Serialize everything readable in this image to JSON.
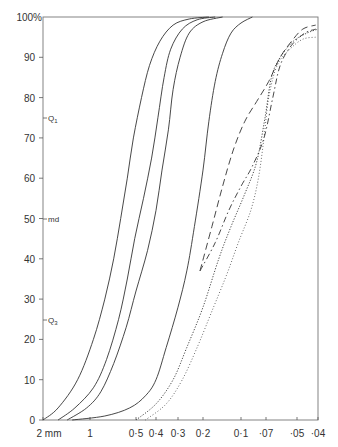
{
  "chart_data": {
    "type": "line",
    "title": "",
    "xlabel": "grain size (mm, log scale, decreasing to right)",
    "ylabel": "cumulative %",
    "y_unit_label": "100%",
    "ylim": [
      0,
      100
    ],
    "grid": false,
    "legend": null,
    "y_ticks": [
      0,
      10,
      20,
      30,
      40,
      50,
      60,
      70,
      80,
      90,
      100
    ],
    "y_tick_labels": [
      "0",
      "10",
      "20",
      "30",
      "40",
      "50",
      "60",
      "70",
      "80",
      "90",
      "100%"
    ],
    "x_ticks": [
      {
        "value": 2,
        "label": "2 mm"
      },
      {
        "value": 1,
        "label": "1"
      },
      {
        "value": 0.5,
        "label": "0·5"
      },
      {
        "value": 0.4,
        "label": "0·4"
      },
      {
        "value": 0.3,
        "label": "0·3"
      },
      {
        "value": 0.2,
        "label": "0·2"
      },
      {
        "value": 0.1,
        "label": "0·1"
      },
      {
        "value": 0.07,
        "label": "·07"
      },
      {
        "value": 0.05,
        "label": "·05"
      },
      {
        "value": 0.04,
        "label": "·04"
      }
    ],
    "annotations": [
      {
        "label": "Q1",
        "y": 75
      },
      {
        "label": "md",
        "y": 50
      },
      {
        "label": "Q3",
        "y": 25
      }
    ],
    "series": [
      {
        "name": "solid-1",
        "style": "solid",
        "points": [
          [
            2,
            0
          ],
          [
            1.6,
            3
          ],
          [
            1.2,
            10
          ],
          [
            0.95,
            20
          ],
          [
            0.8,
            30
          ],
          [
            0.7,
            40
          ],
          [
            0.63,
            50
          ],
          [
            0.57,
            60
          ],
          [
            0.52,
            70
          ],
          [
            0.47,
            80
          ],
          [
            0.43,
            88
          ],
          [
            0.38,
            94
          ],
          [
            0.32,
            98
          ],
          [
            0.25,
            99.5
          ],
          [
            0.18,
            100
          ]
        ]
      },
      {
        "name": "solid-2",
        "style": "solid",
        "points": [
          [
            1.6,
            0
          ],
          [
            1.25,
            3
          ],
          [
            0.95,
            8
          ],
          [
            0.78,
            15
          ],
          [
            0.65,
            25
          ],
          [
            0.57,
            35
          ],
          [
            0.51,
            45
          ],
          [
            0.46,
            55
          ],
          [
            0.42,
            65
          ],
          [
            0.39,
            75
          ],
          [
            0.36,
            85
          ],
          [
            0.33,
            92
          ],
          [
            0.28,
            97
          ],
          [
            0.22,
            99.3
          ],
          [
            0.16,
            100
          ]
        ]
      },
      {
        "name": "solid-3",
        "style": "solid",
        "points": [
          [
            1.4,
            0
          ],
          [
            1.05,
            3
          ],
          [
            0.85,
            7
          ],
          [
            0.7,
            14
          ],
          [
            0.58,
            23
          ],
          [
            0.5,
            32
          ],
          [
            0.44,
            42
          ],
          [
            0.4,
            52
          ],
          [
            0.37,
            62
          ],
          [
            0.34,
            72
          ],
          [
            0.32,
            82
          ],
          [
            0.29,
            90
          ],
          [
            0.25,
            96
          ],
          [
            0.2,
            98.8
          ],
          [
            0.14,
            100
          ]
        ]
      },
      {
        "name": "solid-4",
        "style": "solid",
        "points": [
          [
            1.3,
            0
          ],
          [
            0.8,
            1
          ],
          [
            0.55,
            3
          ],
          [
            0.45,
            6
          ],
          [
            0.4,
            10
          ],
          [
            0.35,
            18
          ],
          [
            0.3,
            28
          ],
          [
            0.26,
            37
          ],
          [
            0.23,
            48
          ],
          [
            0.2,
            62
          ],
          [
            0.18,
            74
          ],
          [
            0.16,
            84
          ],
          [
            0.14,
            91
          ],
          [
            0.12,
            96
          ],
          [
            0.1,
            98.5
          ],
          [
            0.085,
            100
          ]
        ]
      },
      {
        "name": "dashed",
        "style": "dashed",
        "points": [
          [
            0.21,
            37
          ],
          [
            0.17,
            48
          ],
          [
            0.14,
            58
          ],
          [
            0.115,
            67
          ],
          [
            0.095,
            74
          ],
          [
            0.08,
            79
          ],
          [
            0.068,
            84
          ],
          [
            0.06,
            90
          ],
          [
            0.053,
            94
          ],
          [
            0.047,
            97
          ],
          [
            0.041,
            98
          ]
        ]
      },
      {
        "name": "dash-dot",
        "style": "dashdot",
        "points": [
          [
            0.21,
            37
          ],
          [
            0.16,
            44
          ],
          [
            0.125,
            52
          ],
          [
            0.1,
            58
          ],
          [
            0.085,
            63
          ],
          [
            0.072,
            70
          ],
          [
            0.065,
            80
          ],
          [
            0.06,
            88
          ],
          [
            0.053,
            93
          ],
          [
            0.046,
            96
          ],
          [
            0.041,
            97
          ]
        ]
      },
      {
        "name": "dense-dotted",
        "style": "dotted",
        "points": [
          [
            0.5,
            0
          ],
          [
            0.4,
            4
          ],
          [
            0.32,
            10
          ],
          [
            0.26,
            18
          ],
          [
            0.2,
            28
          ],
          [
            0.15,
            40
          ],
          [
            0.12,
            48
          ],
          [
            0.095,
            56
          ],
          [
            0.08,
            64
          ],
          [
            0.071,
            75
          ],
          [
            0.066,
            85
          ],
          [
            0.06,
            90
          ],
          [
            0.052,
            94
          ],
          [
            0.045,
            96
          ],
          [
            0.04,
            97
          ]
        ]
      },
      {
        "name": "sparse-dotted",
        "style": "dotted-fine",
        "points": [
          [
            0.45,
            0
          ],
          [
            0.35,
            4
          ],
          [
            0.28,
            10
          ],
          [
            0.22,
            18
          ],
          [
            0.17,
            27
          ],
          [
            0.13,
            36
          ],
          [
            0.105,
            44
          ],
          [
            0.087,
            52
          ],
          [
            0.078,
            60
          ],
          [
            0.072,
            70
          ],
          [
            0.068,
            80
          ],
          [
            0.062,
            88
          ],
          [
            0.054,
            92
          ],
          [
            0.047,
            94.5
          ],
          [
            0.041,
            95
          ]
        ]
      }
    ]
  },
  "axes": {
    "y_tick_labels": [
      "0",
      "10",
      "20",
      "30",
      "40",
      "50",
      "60",
      "70",
      "80",
      "90",
      "100%"
    ],
    "x_tick_labels": [
      "2 mm",
      "1",
      "0·5",
      "0·4",
      "0·3",
      "0·2",
      "0·1",
      "·07",
      "·05",
      "·04"
    ],
    "annotations": [
      "Q",
      "1",
      "md",
      "Q",
      "3"
    ]
  }
}
